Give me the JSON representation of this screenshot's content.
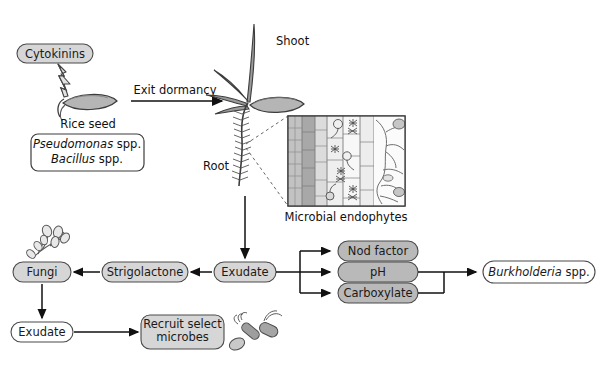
{
  "figure": {
    "colors": {
      "box_fill_gray": "#d6d6d6",
      "box_fill_white": "#ffffff",
      "box_stroke": "#4a4a4a",
      "arrow": "#111111",
      "text": "#111111",
      "seed_fill": "#b0b0b0",
      "tissue_light": "#ededed",
      "tissue_mid": "#c9c9c9",
      "tissue_dark": "#a8a8a8",
      "microbe_fill": "#9a9a9a"
    }
  },
  "nodes": {
    "cytokinins": "Cytokinins",
    "rice_seed": "Rice seed",
    "seed_microbes_line1": "Pseudomonas",
    "seed_microbes_line1_suffix": " spp.",
    "seed_microbes_line2": "Bacillus",
    "seed_microbes_line2_suffix": " spp.",
    "exit_dormancy": "Exit dormancy",
    "shoot": "Shoot",
    "root": "Root",
    "microbial_endophytes": "Microbial endophytes",
    "exudate_root": "Exudate",
    "strigolactone": "Strigolactone",
    "fungi": "Fungi",
    "exudate_fungi": "Exudate",
    "recruit_select_microbes_line1": "Recruit select",
    "recruit_select_microbes_line2": "microbes",
    "nod_factor": "Nod factor",
    "ph": "pH",
    "carboxylate": "Carboxylate",
    "burkholderia": "Burkholderia",
    "burkholderia_suffix": " spp."
  },
  "icons": {
    "lightning": "lightning-bolt-icon",
    "seed": "rice-seed-icon",
    "seedling": "rice-seedling-icon",
    "root_hairs": "root-with-hairs-icon",
    "endophyte_inset": "root-cross-section-inset",
    "fungus": "fungus-hyphae-icon",
    "bacteria": "bacteria-cluster-icon"
  },
  "flows": [
    {
      "from": "cytokinins",
      "to": "rice_seed",
      "style": "lightning"
    },
    {
      "from": "rice_seed",
      "to": "seedling",
      "label": "Exit dormancy",
      "style": "arrow"
    },
    {
      "from": "root",
      "to": "exudate_root",
      "style": "arrow"
    },
    {
      "from": "exudate_root",
      "to": "strigolactone",
      "style": "arrow"
    },
    {
      "from": "strigolactone",
      "to": "fungi",
      "style": "arrow"
    },
    {
      "from": "fungi",
      "to": "exudate_fungi",
      "style": "arrow"
    },
    {
      "from": "exudate_fungi",
      "to": "recruit_select_microbes",
      "style": "arrow"
    },
    {
      "from": "exudate_root",
      "to": "nod_factor",
      "style": "arrow"
    },
    {
      "from": "exudate_root",
      "to": "ph",
      "style": "arrow"
    },
    {
      "from": "exudate_root",
      "to": "carboxylate",
      "style": "arrow"
    },
    {
      "from": "ph_and_carboxylate",
      "to": "burkholderia",
      "style": "arrow"
    }
  ]
}
